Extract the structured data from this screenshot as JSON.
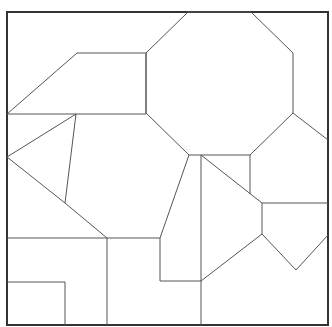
{
  "diagram": {
    "title": "",
    "colors": {
      "background": "#ffffff",
      "frame_stroke": "#333333",
      "piece_stroke": "#555555"
    },
    "pieces": [
      {
        "id": "octagon",
        "shape": "octagon"
      },
      {
        "id": "top-left-trapezoid",
        "shape": "quadrilateral"
      },
      {
        "id": "left-triangle",
        "shape": "triangle"
      },
      {
        "id": "pentagon-right",
        "shape": "pentagon"
      },
      {
        "id": "bottom-left-square",
        "shape": "square"
      }
    ]
  }
}
